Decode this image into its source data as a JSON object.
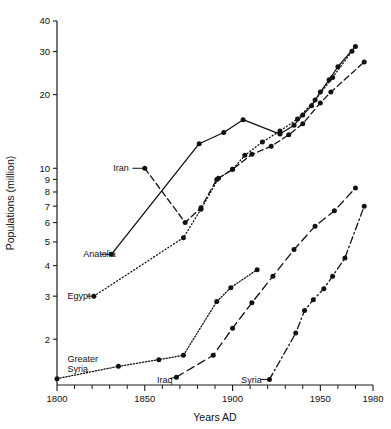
{
  "chart_data": {
    "type": "line",
    "title": "",
    "xlabel": "Years AD",
    "ylabel": "Populations (million)",
    "yscale": "log",
    "xlim": [
      1800,
      1980
    ],
    "ylim": [
      1.3,
      40
    ],
    "grid": false,
    "legend_position": "inline-labels",
    "x_ticks_major": [
      1800,
      1850,
      1900,
      1950,
      1980
    ],
    "x_tick_labels": [
      "1800",
      "1850",
      "1900",
      "1950",
      "1980"
    ],
    "x_ticks_minor": [
      1810,
      1820,
      1830,
      1840,
      1860,
      1870,
      1880,
      1890,
      1910,
      1920,
      1930,
      1940,
      1960,
      1970
    ],
    "y_ticks": [
      40,
      30,
      20,
      10,
      9,
      8,
      7,
      6,
      5,
      4,
      3,
      2
    ],
    "y_tick_labels": [
      "40",
      "30",
      "20",
      "10",
      "9",
      "8",
      "7",
      "6",
      "5",
      "4",
      "3",
      "2"
    ],
    "series": [
      {
        "name": "Anatolia",
        "style": "solid",
        "label": "Anatolia",
        "label_x": 1815,
        "label_y": 4.45,
        "points": [
          {
            "x": 1831,
            "y": 4.45
          },
          {
            "x": 1881,
            "y": 12.6
          },
          {
            "x": 1895,
            "y": 14.0
          },
          {
            "x": 1906,
            "y": 15.8
          },
          {
            "x": 1927,
            "y": 13.8
          },
          {
            "x": 1935,
            "y": 15.0
          },
          {
            "x": 1940,
            "y": 16.5
          },
          {
            "x": 1945,
            "y": 18.0
          },
          {
            "x": 1950,
            "y": 20.5
          },
          {
            "x": 1955,
            "y": 23.0
          },
          {
            "x": 1960,
            "y": 26.0
          },
          {
            "x": 1970,
            "y": 31.5
          }
        ]
      },
      {
        "name": "Egypt",
        "style": "dotted",
        "label": "Egypt",
        "label_x": 1806,
        "label_y": 3.0,
        "points": [
          {
            "x": 1821,
            "y": 3.0
          },
          {
            "x": 1872,
            "y": 5.2
          },
          {
            "x": 1882,
            "y": 6.8
          },
          {
            "x": 1892,
            "y": 9.1
          },
          {
            "x": 1900,
            "y": 9.9
          },
          {
            "x": 1907,
            "y": 11.3
          },
          {
            "x": 1917,
            "y": 12.8
          },
          {
            "x": 1927,
            "y": 14.2
          },
          {
            "x": 1937,
            "y": 15.9
          },
          {
            "x": 1947,
            "y": 19.0
          },
          {
            "x": 1957,
            "y": 23.5
          },
          {
            "x": 1968,
            "y": 30.1
          }
        ]
      },
      {
        "name": "Iran",
        "style": "dashed",
        "label": "Iran",
        "label_x": 1832,
        "label_y": 10.0,
        "points": [
          {
            "x": 1850,
            "y": 10.0
          },
          {
            "x": 1873,
            "y": 6.0
          },
          {
            "x": 1882,
            "y": 6.9
          },
          {
            "x": 1891,
            "y": 9.0
          },
          {
            "x": 1900,
            "y": 9.9
          },
          {
            "x": 1911,
            "y": 11.4
          },
          {
            "x": 1922,
            "y": 12.3
          },
          {
            "x": 1932,
            "y": 13.7
          },
          {
            "x": 1940,
            "y": 15.2
          },
          {
            "x": 1950,
            "y": 18.5
          },
          {
            "x": 1956,
            "y": 20.5
          },
          {
            "x": 1975,
            "y": 27.2
          }
        ]
      },
      {
        "name": "Greater Syria",
        "style": "dotted-fine",
        "label": "Greater\nSyria",
        "label_line1": "Greater",
        "label_line2": "Syria",
        "label_x": 1806,
        "label_y": 1.62,
        "points": [
          {
            "x": 1800,
            "y": 1.38
          },
          {
            "x": 1835,
            "y": 1.55
          },
          {
            "x": 1858,
            "y": 1.65
          },
          {
            "x": 1872,
            "y": 1.72
          },
          {
            "x": 1891,
            "y": 2.85
          },
          {
            "x": 1899,
            "y": 3.25
          },
          {
            "x": 1914,
            "y": 3.85
          }
        ]
      },
      {
        "name": "Iraq",
        "style": "dashed-long",
        "label": "Iraq",
        "label_x": 1857,
        "label_y": 1.36,
        "points": [
          {
            "x": 1868,
            "y": 1.4
          },
          {
            "x": 1889,
            "y": 1.72
          },
          {
            "x": 1900,
            "y": 2.22
          },
          {
            "x": 1911,
            "y": 2.82
          },
          {
            "x": 1923,
            "y": 3.62
          },
          {
            "x": 1935,
            "y": 4.65
          },
          {
            "x": 1947,
            "y": 5.8
          },
          {
            "x": 1958,
            "y": 6.7
          },
          {
            "x": 1970,
            "y": 8.3
          }
        ]
      },
      {
        "name": "Syria",
        "style": "dashdot",
        "label": "Syria",
        "label_x": 1905,
        "label_y": 1.36,
        "points": [
          {
            "x": 1921,
            "y": 1.37
          },
          {
            "x": 1936,
            "y": 2.12
          },
          {
            "x": 1941,
            "y": 2.62
          },
          {
            "x": 1946,
            "y": 2.9
          },
          {
            "x": 1952,
            "y": 3.22
          },
          {
            "x": 1957,
            "y": 3.62
          },
          {
            "x": 1964,
            "y": 4.3
          },
          {
            "x": 1975,
            "y": 7.0
          }
        ]
      }
    ],
    "leaders": [
      {
        "name": "anatolia-leader",
        "from_x": 1825,
        "from_y": 4.45,
        "to_x": 1831,
        "to_y": 4.45
      },
      {
        "name": "egypt-leader",
        "from_x": 1817,
        "from_y": 3.0,
        "to_x": 1821,
        "to_y": 3.0
      },
      {
        "name": "iran-leader",
        "from_x": 1843,
        "from_y": 10.0,
        "to_x": 1850,
        "to_y": 10.0
      },
      {
        "name": "iraq-leader",
        "from_x": 1864,
        "from_y": 1.38,
        "to_x": 1868,
        "to_y": 1.4
      },
      {
        "name": "syria-leader",
        "from_x": 1916,
        "from_y": 1.37,
        "to_x": 1921,
        "to_y": 1.37
      }
    ]
  }
}
